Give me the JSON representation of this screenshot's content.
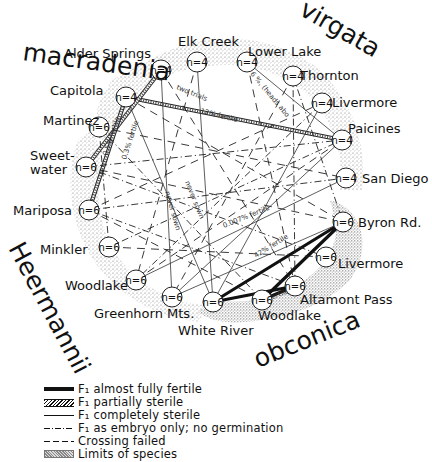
{
  "species": [
    {
      "name": "macradenia",
      "x": 22,
      "y": 60,
      "rotate": 8
    },
    {
      "name": "virgata",
      "x": 298,
      "y": 14,
      "rotate": 30
    },
    {
      "name": "Heermannii",
      "x": 8,
      "y": 248,
      "rotate": 62
    },
    {
      "name": "obconica",
      "x": 258,
      "y": 368,
      "rotate": -22
    }
  ],
  "nodes": [
    {
      "id": "alder-springs",
      "label": "Alder Springs",
      "n": "n=4",
      "x": 161,
      "y": 70,
      "lx": 64,
      "ly": 58
    },
    {
      "id": "elk-creek",
      "label": "Elk Creek",
      "n": "n=4",
      "x": 197,
      "y": 62,
      "lx": 178,
      "ly": 46
    },
    {
      "id": "lower-lake",
      "label": "Lower Lake",
      "n": "n=4",
      "x": 247,
      "y": 62,
      "lx": 248,
      "ly": 56
    },
    {
      "id": "thornton",
      "label": "Thornton",
      "n": "n=4",
      "x": 293,
      "y": 76,
      "lx": 300,
      "ly": 80
    },
    {
      "id": "livermore-top",
      "label": "Livermore",
      "n": "n=4",
      "x": 322,
      "y": 103,
      "lx": 332,
      "ly": 107
    },
    {
      "id": "paicines",
      "label": "Paicines",
      "n": "n=4",
      "x": 342,
      "y": 140,
      "lx": 348,
      "ly": 133
    },
    {
      "id": "san-diego",
      "label": "San Diego",
      "n": "n=4",
      "x": 346,
      "y": 178,
      "lx": 362,
      "ly": 183
    },
    {
      "id": "byron-rd",
      "label": "Byron Rd.",
      "n": "n=6",
      "x": 343,
      "y": 222,
      "lx": 358,
      "ly": 227
    },
    {
      "id": "livermore-low",
      "label": "Livermore",
      "n": "n=6",
      "x": 326,
      "y": 257,
      "lx": 338,
      "ly": 268
    },
    {
      "id": "altamont-pass",
      "label": "Altamont Pass",
      "n": "n=6",
      "x": 295,
      "y": 286,
      "lx": 300,
      "ly": 304
    },
    {
      "id": "woodlake-right",
      "label": "Woodlake",
      "n": "n=6",
      "x": 262,
      "y": 300,
      "lx": 258,
      "ly": 320
    },
    {
      "id": "white-river",
      "label": "White River",
      "n": "n=6",
      "x": 213,
      "y": 302,
      "lx": 178,
      "ly": 335
    },
    {
      "id": "greenhorn-mts",
      "label": "Greenhorn Mts.",
      "n": "n=6",
      "x": 172,
      "y": 297,
      "lx": 94,
      "ly": 318
    },
    {
      "id": "woodlake-left",
      "label": "Woodlake",
      "n": "n=6",
      "x": 136,
      "y": 280,
      "lx": 65,
      "ly": 290
    },
    {
      "id": "minkler",
      "label": "Minkler",
      "n": "n=6",
      "x": 109,
      "y": 247,
      "lx": 40,
      "ly": 254
    },
    {
      "id": "mariposa",
      "label": "Mariposa",
      "n": "n=6",
      "x": 89,
      "y": 210,
      "lx": 13,
      "ly": 215
    },
    {
      "id": "sweetwater",
      "label": "Sweet-\nwater",
      "n": "n=6",
      "x": 86,
      "y": 167,
      "lx": 30,
      "ly": 160
    },
    {
      "id": "martinez",
      "label": "Martinez",
      "n": "n=6",
      "x": 99,
      "y": 127,
      "lx": 43,
      "ly": 125
    },
    {
      "id": "capitola",
      "label": "Capitola",
      "n": "n=4",
      "x": 126,
      "y": 97,
      "lx": 50,
      "ly": 95
    }
  ],
  "edges": [
    {
      "from": "capitola",
      "to": "paicines",
      "type": "partial"
    },
    {
      "from": "alder-springs",
      "to": "sweetwater",
      "type": "partial"
    },
    {
      "from": "capitola",
      "to": "mariposa",
      "type": "partial"
    },
    {
      "from": "byron-rd",
      "to": "white-river",
      "type": "fertile"
    },
    {
      "from": "byron-rd",
      "to": "woodlake-right",
      "type": "fertile"
    },
    {
      "from": "altamont-pass",
      "to": "white-river",
      "type": "fertile"
    },
    {
      "from": "altamont-pass",
      "to": "woodlake-right",
      "type": "fertile"
    },
    {
      "from": "lower-lake",
      "to": "paicines",
      "type": "sterile"
    },
    {
      "from": "san-diego",
      "to": "woodlake-left",
      "type": "sterile"
    },
    {
      "from": "capitola",
      "to": "white-river",
      "type": "sterile"
    },
    {
      "from": "alder-springs",
      "to": "greenhorn-mts",
      "type": "sterile"
    },
    {
      "from": "elk-creek",
      "to": "white-river",
      "type": "sterile"
    },
    {
      "from": "paicines",
      "to": "greenhorn-mts",
      "type": "sterile"
    },
    {
      "from": "livermore-top",
      "to": "white-river",
      "type": "sterile"
    },
    {
      "from": "byron-rd",
      "to": "greenhorn-mts",
      "type": "sterile"
    },
    {
      "from": "thornton",
      "to": "byron-rd",
      "type": "embryo"
    },
    {
      "from": "thornton",
      "to": "altamont-pass",
      "type": "embryo"
    },
    {
      "from": "sweetwater",
      "to": "paicines",
      "type": "embryo"
    },
    {
      "from": "mariposa",
      "to": "san-diego",
      "type": "embryo"
    },
    {
      "from": "martinez",
      "to": "minkler",
      "type": "embryo"
    },
    {
      "from": "mariposa",
      "to": "altamont-pass",
      "type": "embryo"
    },
    {
      "from": "sweetwater",
      "to": "livermore-low",
      "type": "embryo"
    },
    {
      "from": "livermore-top",
      "to": "woodlake-left",
      "type": "embryo"
    },
    {
      "from": "minkler",
      "to": "paicines",
      "type": "embryo"
    },
    {
      "from": "martinez",
      "to": "woodlake-right",
      "type": "embryo"
    },
    {
      "from": "capitola",
      "to": "byron-rd",
      "type": "failed"
    },
    {
      "from": "alder-springs",
      "to": "altamont-pass",
      "type": "failed"
    },
    {
      "from": "elk-creek",
      "to": "woodlake-left",
      "type": "failed"
    },
    {
      "from": "martinez",
      "to": "san-diego",
      "type": "failed"
    },
    {
      "from": "sweetwater",
      "to": "byron-rd",
      "type": "failed"
    },
    {
      "from": "mariposa",
      "to": "livermore-top",
      "type": "failed"
    },
    {
      "from": "minkler",
      "to": "livermore-low",
      "type": "failed"
    },
    {
      "from": "woodlake-left",
      "to": "paicines",
      "type": "failed"
    },
    {
      "from": "thornton",
      "to": "greenhorn-mts",
      "type": "failed"
    },
    {
      "from": "lower-lake",
      "to": "altamont-pass",
      "type": "failed"
    },
    {
      "from": "mariposa",
      "to": "woodlake-right",
      "type": "failed"
    }
  ],
  "line_notes": [
    {
      "text": "two trials",
      "x": 176,
      "y": 89,
      "rotate": 22
    },
    {
      "text": "12% fertile",
      "x": 200,
      "y": 113,
      "rotate": 14
    },
    {
      "text": "6 %, (heads abo",
      "x": 250,
      "y": 74,
      "rotate": 50
    },
    {
      "text": "0.5% fertile",
      "x": 107,
      "y": 156,
      "rotate": -72
    },
    {
      "text": "0.3% fertile",
      "x": 126,
      "y": 160,
      "rotate": -72
    },
    {
      "text": "never sown",
      "x": 185,
      "y": 182,
      "rotate": 68
    },
    {
      "text": "never sown",
      "x": 165,
      "y": 192,
      "rotate": 74
    },
    {
      "text": "0.007% fertile",
      "x": 224,
      "y": 228,
      "rotate": -22
    },
    {
      "text": "42% fertile",
      "x": 256,
      "y": 258,
      "rotate": -32
    },
    {
      "text": "fertile",
      "x": 270,
      "y": 300,
      "rotate": -20
    }
  ],
  "legend": [
    {
      "style": "thick",
      "label": "F₁ almost fully fertile"
    },
    {
      "style": "hatch",
      "label": "F₁ partially sterile"
    },
    {
      "style": "thin",
      "label": "F₁ completely sterile"
    },
    {
      "style": "dashdot",
      "label": "F₁ as embryo only; no germination"
    },
    {
      "style": "dash",
      "label": "Crossing failed"
    },
    {
      "style": "stipple",
      "label": "Limits of species"
    }
  ]
}
